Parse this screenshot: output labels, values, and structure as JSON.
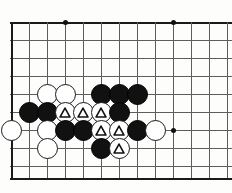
{
  "figure": {
    "name": "go-board-diagram",
    "width": 232,
    "height": 193,
    "background_color": "#fdfdfc"
  },
  "board": {
    "line_color": "#5d5d5d",
    "edge_color": "#1a1a1a",
    "cell_size": 18,
    "origin_x": 11,
    "origin_y": 22,
    "columns": 13,
    "rows": 9,
    "left_edge_is_board_border": true,
    "top_edge_is_board_border": true,
    "bottom_edge_is_board_border": true,
    "right_edge_is_board_border": false,
    "vertical_lines_x": [
      11,
      29,
      47,
      65,
      83,
      101,
      119,
      137,
      155,
      173,
      191,
      209,
      227
    ],
    "horizontal_lines_y": [
      22,
      40,
      58,
      76,
      94,
      112,
      130,
      148,
      166,
      178
    ],
    "star_points": [
      {
        "name": "star-point-top-left",
        "x": 65,
        "y": 22
      },
      {
        "name": "star-point-top-right",
        "x": 173,
        "y": 22
      },
      {
        "name": "star-point-lower-right",
        "x": 173,
        "y": 130
      }
    ]
  },
  "stones": [
    {
      "id": "w-c2-r4",
      "color": "white",
      "x": 47,
      "y": 94,
      "marked": false,
      "label": "white-stone"
    },
    {
      "id": "w-c3-r4",
      "color": "white",
      "x": 65,
      "y": 94,
      "marked": false,
      "label": "white-stone"
    },
    {
      "id": "b-c5-r4",
      "color": "black",
      "x": 101,
      "y": 94,
      "marked": false,
      "label": "black-stone"
    },
    {
      "id": "b-c6-r4",
      "color": "black",
      "x": 119,
      "y": 94,
      "marked": false,
      "label": "black-stone"
    },
    {
      "id": "b-c7-r4",
      "color": "black",
      "x": 137,
      "y": 94,
      "marked": false,
      "label": "black-stone"
    },
    {
      "id": "b-c1-r5",
      "color": "black",
      "x": 29,
      "y": 112,
      "marked": false,
      "label": "black-stone"
    },
    {
      "id": "b-c2-r5",
      "color": "black",
      "x": 47,
      "y": 112,
      "marked": false,
      "label": "black-stone"
    },
    {
      "id": "w-c3-r5",
      "color": "white",
      "x": 65,
      "y": 112,
      "marked": true,
      "label": "white-stone-marked"
    },
    {
      "id": "w-c4-r5",
      "color": "white",
      "x": 83,
      "y": 112,
      "marked": true,
      "label": "white-stone-marked"
    },
    {
      "id": "w-c5-r5",
      "color": "white",
      "x": 101,
      "y": 112,
      "marked": true,
      "label": "white-stone-marked"
    },
    {
      "id": "b-c6-r5",
      "color": "black",
      "x": 119,
      "y": 112,
      "marked": false,
      "label": "black-stone"
    },
    {
      "id": "w-c0-r6",
      "color": "white",
      "x": 11,
      "y": 130,
      "marked": false,
      "label": "white-stone"
    },
    {
      "id": "w-c2-r6",
      "color": "white",
      "x": 47,
      "y": 130,
      "marked": false,
      "label": "white-stone"
    },
    {
      "id": "b-c3-r6",
      "color": "black",
      "x": 65,
      "y": 130,
      "marked": false,
      "label": "black-stone"
    },
    {
      "id": "b-c4-r6",
      "color": "black",
      "x": 83,
      "y": 130,
      "marked": false,
      "label": "black-stone"
    },
    {
      "id": "w-c5-r6",
      "color": "white",
      "x": 101,
      "y": 130,
      "marked": true,
      "label": "white-stone-marked"
    },
    {
      "id": "w-c6-r6",
      "color": "white",
      "x": 119,
      "y": 130,
      "marked": true,
      "label": "white-stone-marked"
    },
    {
      "id": "b-c7-r6",
      "color": "black",
      "x": 137,
      "y": 130,
      "marked": false,
      "label": "black-stone"
    },
    {
      "id": "w-c8-r6",
      "color": "white",
      "x": 155,
      "y": 130,
      "marked": false,
      "label": "white-stone"
    },
    {
      "id": "w-c2-r7",
      "color": "white",
      "x": 47,
      "y": 148,
      "marked": false,
      "label": "white-stone"
    },
    {
      "id": "b-c5-r7",
      "color": "black",
      "x": 101,
      "y": 148,
      "marked": false,
      "label": "black-stone"
    },
    {
      "id": "w-c6-r7",
      "color": "white",
      "x": 119,
      "y": 148,
      "marked": true,
      "label": "white-stone-marked"
    }
  ],
  "marker": {
    "shape": "triangle",
    "stroke_color": "#111111",
    "count": 6
  }
}
